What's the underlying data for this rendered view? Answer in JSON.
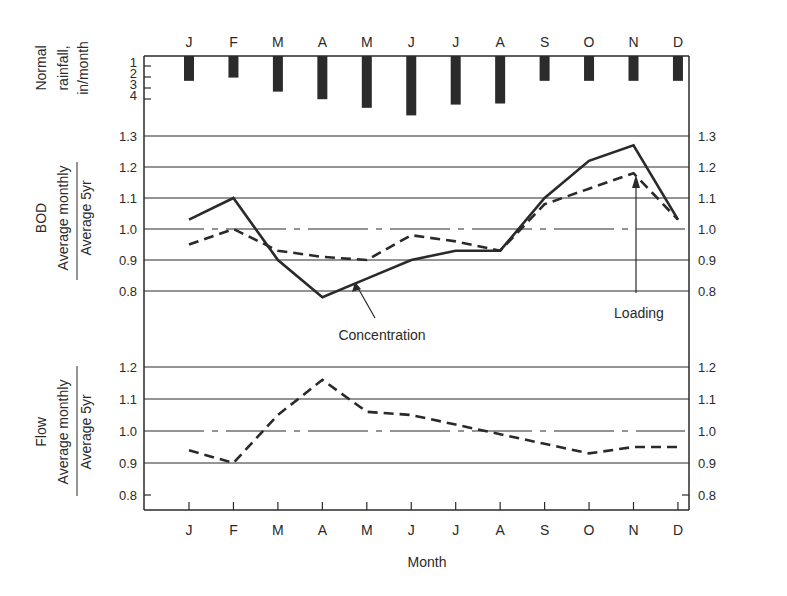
{
  "chart_data": [
    {
      "type": "bar",
      "title": "Normal rainfall",
      "ylabel": "Normal rainfall, in/month",
      "categories": [
        "J",
        "F",
        "M",
        "A",
        "M",
        "J",
        "J",
        "A",
        "S",
        "O",
        "N",
        "D"
      ],
      "values": [
        2.3,
        2.0,
        3.3,
        4.0,
        4.8,
        5.5,
        4.5,
        4.4,
        2.3,
        2.3,
        2.3,
        2.3
      ],
      "yticks": [
        "1",
        "2",
        "3",
        "4"
      ],
      "ylim": [
        0,
        4
      ],
      "orientation": "hanging from top axis"
    },
    {
      "type": "line",
      "title": "BOD",
      "ylabel": "BOD  Average monthly / Average 5yr",
      "categories": [
        "J",
        "F",
        "M",
        "A",
        "M",
        "J",
        "J",
        "A",
        "S",
        "O",
        "N",
        "D"
      ],
      "series": [
        {
          "name": "Concentration",
          "style": "solid",
          "values": [
            1.03,
            1.1,
            0.9,
            0.78,
            0.84,
            0.9,
            0.93,
            0.93,
            1.1,
            1.22,
            1.27,
            1.03
          ]
        },
        {
          "name": "Loading",
          "style": "dashed",
          "values": [
            0.95,
            1.0,
            0.93,
            0.91,
            0.9,
            0.98,
            0.96,
            0.93,
            1.08,
            1.13,
            1.18,
            1.03
          ]
        }
      ],
      "reference_line": 1.0,
      "yticks": [
        "0.8",
        "0.9",
        "1.0",
        "1.1",
        "1.2",
        "1.3"
      ],
      "ylim": [
        0.7,
        1.35
      ],
      "grid": true,
      "annotations": [
        "Concentration",
        "Loading"
      ]
    },
    {
      "type": "line",
      "title": "Flow",
      "ylabel": "Flow  Average monthly / Average 5yr",
      "xlabel": "Month",
      "categories": [
        "J",
        "F",
        "M",
        "A",
        "M",
        "J",
        "J",
        "A",
        "S",
        "O",
        "N",
        "D"
      ],
      "series": [
        {
          "name": "Flow",
          "style": "dashed",
          "values": [
            0.94,
            0.9,
            1.05,
            1.16,
            1.06,
            1.05,
            1.02,
            0.99,
            0.96,
            0.93,
            0.95,
            0.95
          ]
        }
      ],
      "reference_line": 1.0,
      "yticks": [
        "0.8",
        "0.9",
        "1.0",
        "1.1",
        "1.2"
      ],
      "ylim": [
        0.75,
        1.2
      ],
      "grid": true
    }
  ],
  "labels": {
    "months": [
      "J",
      "F",
      "M",
      "A",
      "M",
      "J",
      "J",
      "A",
      "S",
      "O",
      "N",
      "D"
    ],
    "rain_label": [
      "Normal",
      "rainfall,",
      "in/month"
    ],
    "rain_ticks": [
      "1",
      "2",
      "3",
      "4"
    ],
    "bod_title": "BOD",
    "ratio_numerator": "Average monthly",
    "ratio_denominator": "Average 5yr",
    "flow_title": "Flow",
    "bod_ticks": [
      "1.3",
      "1.2",
      "1.1",
      "1.0",
      "0.9",
      "0.8"
    ],
    "flow_ticks": [
      "1.2",
      "1.1",
      "1.0",
      "0.9",
      "0.8"
    ],
    "concentration_label": "Concentration",
    "loading_label": "Loading",
    "xlabel": "Month"
  },
  "colors": {
    "ink": "#2a2a2a",
    "bars": "#2b2b2b",
    "background": "#ffffff"
  }
}
